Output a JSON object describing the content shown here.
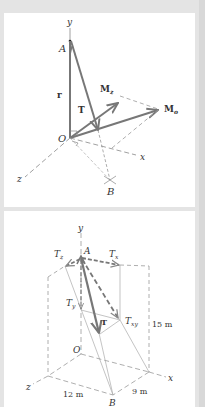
{
  "figure_top": {
    "labels": {
      "y_axis": "y",
      "x_axis": "x",
      "z_axis": "z",
      "point_A": "A",
      "origin": "O",
      "point_B": "B",
      "position_vector": "r",
      "tension": "T",
      "moment_z": "M",
      "moment_z_sub": "z",
      "moment_o": "M",
      "moment_o_sub": "o"
    }
  },
  "figure_bottom": {
    "labels": {
      "y_axis": "y",
      "x_axis": "x",
      "z_axis": "z",
      "point_A": "A",
      "origin": "O",
      "point_B": "B",
      "tension": "T",
      "t_z": "T",
      "t_z_sub": "z",
      "t_x": "T",
      "t_x_sub": "x",
      "t_y": "T",
      "t_y_sub": "y",
      "t_xy": "T",
      "t_xy_sub": "xy"
    },
    "dimensions": {
      "height": "15 m",
      "z_length": "12 m",
      "x_length": "9 m"
    }
  },
  "colors": {
    "vector": "#777777",
    "dashed": "#999999",
    "text": "#333333",
    "background": "#ffffff",
    "frame": "#e4e4e4"
  }
}
